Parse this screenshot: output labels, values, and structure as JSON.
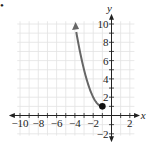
{
  "bullet": "•",
  "chart_data": {
    "type": "line",
    "title": "",
    "xlabel": "x",
    "ylabel": "y",
    "xlim": [
      -11,
      3
    ],
    "ylim": [
      -2,
      11
    ],
    "grid": true,
    "x_ticks": [
      -10,
      -8,
      -6,
      -4,
      -2,
      2
    ],
    "x_tick_labels": [
      "−10",
      "−8",
      "−6",
      "−4",
      "−2",
      "2"
    ],
    "y_ticks": [
      10,
      8,
      6,
      4,
      2,
      -2
    ],
    "y_tick_labels": [
      "10",
      "8",
      "6",
      "4",
      "2",
      "−2"
    ],
    "series": [
      {
        "name": "curve",
        "function": "y = (x+1)^2 + 1",
        "x": [
          -1,
          -1.5,
          -2,
          -2.5,
          -3,
          -3.5,
          -4
        ],
        "y": [
          1,
          1.25,
          2,
          3.25,
          5,
          7.25,
          10
        ],
        "start_point": {
          "x": -1,
          "y": 1,
          "style": "closed-dot"
        },
        "end": "arrow",
        "color": "#666666"
      }
    ],
    "legend": "none"
  }
}
